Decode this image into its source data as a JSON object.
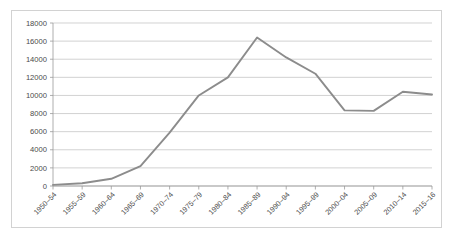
{
  "chart_data": {
    "type": "line",
    "title": "",
    "subtitle": "",
    "xlabel": "",
    "ylabel": "",
    "categories": [
      "1950–54",
      "1955–59",
      "1960–64",
      "1965–69",
      "1970–74",
      "1975–79",
      "1980–84",
      "1985–89",
      "1990–94",
      "1995–99",
      "2000–04",
      "2005–09",
      "2010–14",
      "2015–16"
    ],
    "series": [
      {
        "name": "series-1",
        "color": "#8c8c8c",
        "values": [
          120,
          300,
          800,
          2200,
          5900,
          10000,
          12000,
          16400,
          14200,
          12400,
          8350,
          8300,
          10400,
          10100
        ]
      }
    ],
    "ylim": [
      0,
      18000
    ],
    "ytick_values": [
      0,
      2000,
      4000,
      6000,
      8000,
      10000,
      12000,
      14000,
      16000,
      18000
    ],
    "ytick_labels": [
      "0",
      "2000",
      "4000",
      "6000",
      "8000",
      "10000",
      "12000",
      "14000",
      "16000",
      "18000"
    ],
    "grid": {
      "horizontal": true,
      "vertical": false,
      "color": "#bfbfbf"
    },
    "legend": {
      "visible": false,
      "position": "none",
      "entries": []
    },
    "axis": {
      "y_axis_line_color": "#9a9a9a",
      "x_axis_line_color": "#9a9a9a",
      "x_label_rotation_deg": -45
    },
    "plot_border_color": "#d2d2d2",
    "background_color": "#ffffff"
  }
}
